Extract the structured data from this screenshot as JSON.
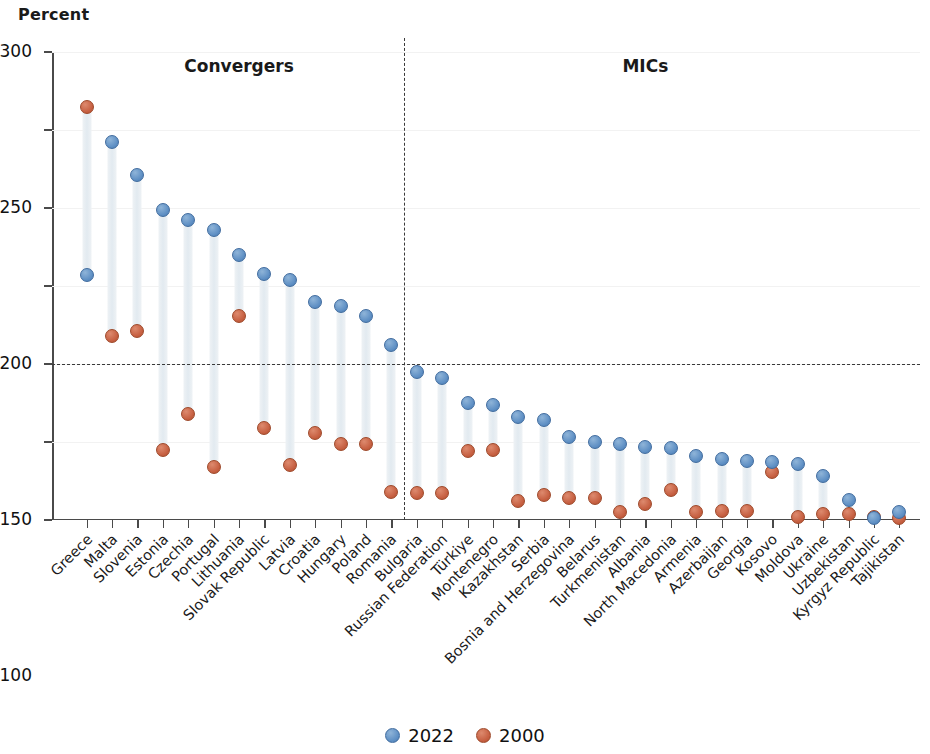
{
  "axis_title": "Percent",
  "legend": {
    "items": [
      {
        "label": "2022",
        "color": "#5e8fc4",
        "icon": "circle-marker-icon"
      },
      {
        "label": "2000",
        "color": "#c65f41",
        "icon": "circle-marker-icon"
      }
    ]
  },
  "groups": [
    {
      "label": "Convergers",
      "start": 0,
      "end": 12
    },
    {
      "label": "MICs",
      "start": 13,
      "end": 31
    }
  ],
  "chart_data": {
    "type": "scatter",
    "title": "",
    "subtitle": "",
    "xlabel": "",
    "ylabel": "Percent",
    "ylim": [
      0,
      300
    ],
    "yticks": [
      0,
      50,
      100,
      150,
      200,
      250,
      300
    ],
    "ytick_labels": [
      "0",
      "50",
      "100",
      "150",
      "200",
      "250",
      "300"
    ],
    "grid": true,
    "legend_position": "bottom",
    "reference_lines": [
      {
        "orientation": "horizontal",
        "value": 100,
        "style": "dashed"
      },
      {
        "orientation": "vertical",
        "between": [
          "Romania",
          "Bulgaria"
        ],
        "style": "dashed"
      }
    ],
    "annotations": [
      "Convergers",
      "MICs"
    ],
    "categories": [
      "Greece",
      "Malta",
      "Slovenia",
      "Estonia",
      "Czechia",
      "Portugal",
      "Lithuania",
      "Slovak Republic",
      "Latvia",
      "Croatia",
      "Hungary",
      "Poland",
      "Romania",
      "Bulgaria",
      "Russian Federation",
      "Türkiye",
      "Montenegro",
      "Kazakhstan",
      "Serbia",
      "Bosnia and Herzegovina",
      "Belarus",
      "Turkmenistan",
      "Albania",
      "North Macedonia",
      "Armenia",
      "Azerbaijan",
      "Georgia",
      "Kosovo",
      "Moldova",
      "Ukraine",
      "Uzbekistan",
      "Kyrgyz Republic",
      "Tajikistan"
    ],
    "series": [
      {
        "name": "2022",
        "color": "#5e8fc4",
        "values": [
          157,
          242,
          221,
          199,
          192,
          186,
          170,
          158,
          154,
          140,
          137,
          131,
          112,
          95,
          91,
          75,
          74,
          66,
          64,
          53,
          50,
          49,
          47,
          46,
          41,
          39,
          38,
          37,
          36,
          28,
          13,
          1,
          5
        ]
      },
      {
        "name": "2000",
        "color": "#c65f41",
        "values": [
          265,
          118,
          121,
          45,
          68,
          34,
          131,
          59,
          35,
          56,
          49,
          49,
          18,
          17,
          17,
          44,
          45,
          12,
          16,
          14,
          14,
          5,
          10,
          19,
          5,
          6,
          6,
          31,
          2,
          4,
          4,
          2,
          1
        ]
      }
    ]
  }
}
